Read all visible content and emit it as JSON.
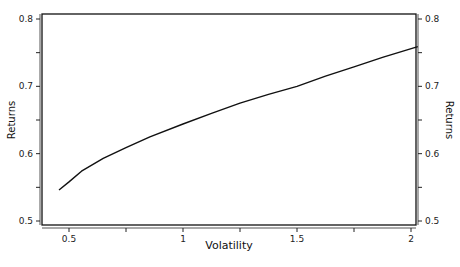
{
  "chart_data": {
    "type": "line",
    "title": "",
    "xlabel": "Volatility",
    "ylabel": "Returns",
    "ylabel_right": "Returns",
    "xlim": [
      0.4,
      2.03
    ],
    "ylim": [
      0.495,
      0.805
    ],
    "x_ticks": [
      0.5,
      0.75,
      1,
      1.25,
      1.5,
      1.75,
      2
    ],
    "x_tick_labels": [
      "0.5",
      "",
      "1",
      "",
      "1.5",
      "",
      "2"
    ],
    "y_ticks": [
      0.5,
      0.55,
      0.6,
      0.65,
      0.7,
      0.75,
      0.8
    ],
    "y_tick_labels": [
      "0.5",
      "",
      "0.6",
      "",
      "0.7",
      "",
      "0.8"
    ],
    "grid": false,
    "legend": null,
    "series": [
      {
        "name": "Efficient frontier",
        "color": "#111111",
        "x": [
          0.456,
          0.5,
          0.555,
          0.65,
          0.75,
          0.855,
          1.0,
          1.125,
          1.25,
          1.375,
          1.5,
          1.625,
          1.75,
          1.875,
          2.03
        ],
        "y": [
          0.546,
          0.558,
          0.574,
          0.593,
          0.609,
          0.625,
          0.644,
          0.66,
          0.675,
          0.688,
          0.7,
          0.715,
          0.729,
          0.743,
          0.759
        ]
      }
    ]
  },
  "labels": {
    "x_axis_title": "Volatility",
    "y_axis_title_left": "Returns",
    "y_axis_title_right": "Returns"
  }
}
